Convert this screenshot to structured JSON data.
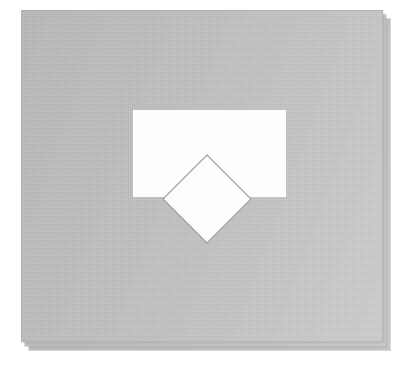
{
  "canvas": {
    "title": "Shape Overlap Canvas",
    "width": 401,
    "height": 367,
    "background_color": "#ffffff"
  },
  "panel": {
    "name": "Sheet",
    "x": 21,
    "y": 10,
    "width": 362,
    "height": 332,
    "fill_start_color": "#b4b4b4",
    "fill_end_color": "#cacaca",
    "border_color": "#a8a8a8",
    "texture": "paper-grain"
  },
  "stack": {
    "layer_count": 3,
    "offset_x": 4,
    "offset_y": 4,
    "back_layers": [
      {
        "label": "Sheet 2",
        "x": 25,
        "y": 15,
        "width": 361,
        "height": 331,
        "fill_color": "#c0c0c0"
      },
      {
        "label": "Sheet 3",
        "x": 29,
        "y": 19,
        "width": 361,
        "height": 331,
        "fill_color": "#bdbdbd"
      }
    ]
  },
  "shapes": [
    {
      "id": "rect-1",
      "type": "rectangle",
      "label": "Rectangle",
      "x": 133,
      "y": 110,
      "width": 153,
      "height": 87,
      "fill_color": "#fdfdfd",
      "stroke_color": "none",
      "z_index": 1
    },
    {
      "id": "diamond-1",
      "type": "diamond",
      "label": "Diamond",
      "center_x": 206,
      "center_y": 199,
      "half_width": 43,
      "half_height": 43,
      "fill_color": "#fdfdfd",
      "stroke_color": "#9b9b9b",
      "stroke_width": 1.1,
      "rotation": 45,
      "z_index": 2
    }
  ],
  "diamond_points": "46,2 90,46 46,90 2,46"
}
